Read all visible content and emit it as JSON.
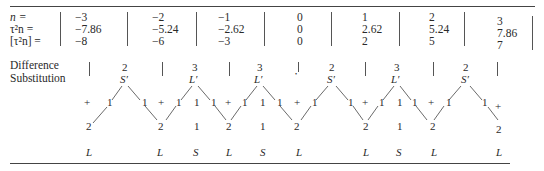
{
  "table": {
    "row_labels": {
      "n": "n =",
      "tau2n": "τ²n =",
      "floor_tau2n": "[τ²n] ="
    },
    "columns": [
      {
        "n": "−3",
        "tau2n": "−7.86",
        "floor": "−8"
      },
      {
        "n": "−2",
        "tau2n": "−5.24",
        "floor": "−6"
      },
      {
        "n": "−1",
        "tau2n": "−2.62",
        "floor": "−3"
      },
      {
        "n": "0",
        "tau2n": "0",
        "floor": "0"
      },
      {
        "n": "1",
        "tau2n": "2.62",
        "floor": "2"
      },
      {
        "n": "2",
        "tau2n": "5.24",
        "floor": "5"
      },
      {
        "n": "3",
        "tau2n": "7.86",
        "floor": "7"
      }
    ]
  },
  "diagram": {
    "label_line1": "Difference",
    "label_line2": "Substitution",
    "peaks": [
      {
        "num": "2",
        "sym": "S′"
      },
      {
        "num": "3",
        "sym": "L′"
      },
      {
        "num": "3",
        "sym": "L′"
      },
      {
        "num": "2",
        "sym": "S′"
      },
      {
        "num": "3",
        "sym": "L′"
      },
      {
        "num": "2",
        "sym": "S′"
      }
    ],
    "center_dot": "•",
    "plus": "+",
    "one": "1",
    "two": "2",
    "letters": [
      "L",
      "L",
      "S",
      "L",
      "S",
      "L",
      "L",
      "S",
      "L",
      "L"
    ]
  }
}
